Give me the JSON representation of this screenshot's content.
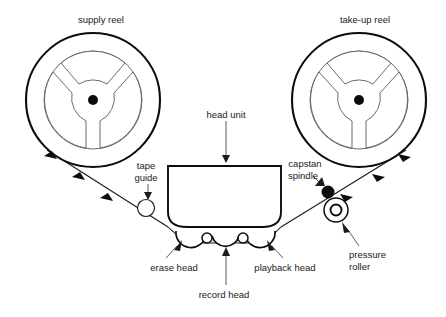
{
  "diagram": {
    "background_color": "#ffffff",
    "line_color": "#0d0d0d",
    "detail_color": "#5a5a5a",
    "labels": {
      "supply_reel": "supply reel",
      "take_up_reel": "take-up reel",
      "head_unit": "head unit",
      "tape_guide_line1": "tape",
      "tape_guide_line2": "guide",
      "capstan_line1": "capstan",
      "capstan_line2": "spindle",
      "pressure_line1": "pressure",
      "pressure_line2": "roller",
      "erase_head": "erase head",
      "record_head": "record head",
      "playback_head": "playback head"
    },
    "components": [
      {
        "id": "supply-reel",
        "name": "supply reel",
        "cx": 93,
        "cy": 100,
        "r_outer": 67,
        "r_inner": 49,
        "hub_r": 5
      },
      {
        "id": "take-up-reel",
        "name": "take-up reel",
        "cx": 359,
        "cy": 100,
        "r_outer": 67,
        "r_inner": 49,
        "hub_r": 5
      },
      {
        "id": "head-unit",
        "name": "head unit",
        "x": 168,
        "y": 166,
        "width": 113,
        "height": 60
      },
      {
        "id": "tape-guide",
        "name": "tape guide",
        "cx": 146,
        "cy": 208,
        "r": 8.5
      },
      {
        "id": "capstan-spindle",
        "name": "capstan spindle",
        "cx": 328,
        "cy": 192,
        "r": 6.5
      },
      {
        "id": "pressure-roller",
        "name": "pressure roller",
        "cx": 336,
        "cy": 210,
        "r_outer": 12,
        "r_inner": 5.5
      },
      {
        "id": "erase-head",
        "name": "erase head"
      },
      {
        "id": "record-head",
        "name": "record head"
      },
      {
        "id": "playback-head",
        "name": "playback head"
      }
    ],
    "tape_direction": "supply reel to take-up reel (left to right)",
    "direction_arrow_count_left": 3,
    "direction_arrow_count_right": 3
  }
}
